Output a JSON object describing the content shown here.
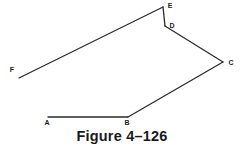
{
  "figure": {
    "caption": "Figure 4–126",
    "background_color": "#ffffff",
    "line_color": "#2b2b2b",
    "label_color": "#1a1a1a",
    "line_width": 1.3,
    "width": 244,
    "height": 150
  },
  "diagram": {
    "type": "open-polyline",
    "path_order": [
      "A",
      "B",
      "C",
      "D",
      "E",
      "F"
    ],
    "points": [
      {
        "label": "A",
        "x": 48,
        "y": 117,
        "label_x": 47,
        "label_y": 125,
        "anchor": "middle"
      },
      {
        "label": "B",
        "x": 128,
        "y": 117,
        "label_x": 127,
        "label_y": 125,
        "anchor": "middle"
      },
      {
        "label": "C",
        "x": 223,
        "y": 62,
        "label_x": 231,
        "label_y": 65,
        "anchor": "middle"
      },
      {
        "label": "D",
        "x": 165,
        "y": 26,
        "label_x": 172,
        "label_y": 28,
        "anchor": "middle"
      },
      {
        "label": "E",
        "x": 163,
        "y": 7,
        "label_x": 170,
        "label_y": 8,
        "anchor": "middle"
      },
      {
        "label": "F",
        "x": 19,
        "y": 78,
        "label_x": 12,
        "label_y": 72,
        "anchor": "middle"
      }
    ],
    "segments": [
      {
        "from": "A",
        "to": "B"
      },
      {
        "from": "B",
        "to": "C"
      },
      {
        "from": "C",
        "to": "D"
      },
      {
        "from": "D",
        "to": "E"
      },
      {
        "from": "E",
        "to": "F"
      }
    ]
  }
}
